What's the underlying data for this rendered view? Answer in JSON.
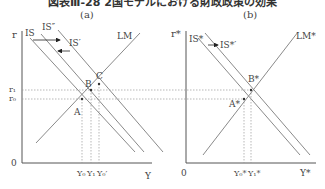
{
  "figure": {
    "title": "図表Ⅲ-28 2国モデルにおける財政政策の効果",
    "colors": {
      "line": "#8a8a8a",
      "axis": "#555555",
      "dashed": "#9a9a9a",
      "text": "#444444"
    }
  },
  "panel_a": {
    "label": "(a)",
    "y_axis_label": "r",
    "x_axis_label": "Y",
    "origin_label": "0",
    "curves": {
      "is": "IS",
      "is_double_prime": "IS″",
      "is_prime": "IS′",
      "lm": "LM"
    },
    "points": {
      "a": "A",
      "b": "B",
      "c": "C"
    },
    "y_ticks": {
      "r1": "r₁",
      "r0": "r₀"
    },
    "x_ticks": {
      "y0": "Y₀",
      "y1": "Y₁",
      "y0_prime": "Y₀′"
    }
  },
  "panel_b": {
    "label": "(b)",
    "y_axis_label": "r*",
    "x_axis_label": "Y*",
    "origin_label": "0",
    "curves": {
      "is_star": "IS*",
      "is_star_prime": "IS*′",
      "lm_star": "LM*"
    },
    "points": {
      "a_star": "A*",
      "b_star": "B*"
    },
    "x_ticks": {
      "y0_star": "Y₀*",
      "y1_star": "Y₁*"
    }
  }
}
